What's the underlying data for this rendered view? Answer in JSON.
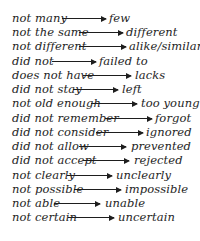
{
  "pairs": [
    {
      "from": "not many",
      "to": "few"
    },
    {
      "from": "not the same",
      "to": "different"
    },
    {
      "from": "not different",
      "to": "alike/similar"
    },
    {
      "from": "did not",
      "to": "failed to"
    },
    {
      "from": "does not have",
      "to": "lacks"
    },
    {
      "from": "did not stay",
      "to": "left"
    },
    {
      "from": "not old enough",
      "to": "too young"
    },
    {
      "from": "did not remember",
      "to": "forgot"
    },
    {
      "from": "did not consider",
      "to": "ignored"
    },
    {
      "from": "did not allow",
      "to": "prevented"
    },
    {
      "from": "did not accept",
      "to": "rejected"
    },
    {
      "from": "not clearly",
      "to": "unclearly"
    },
    {
      "from": "not possible",
      "to": "impossible"
    },
    {
      "from": "not able",
      "to": "unable"
    },
    {
      "from": "not certain",
      "to": "uncertain"
    }
  ],
  "icons": {
    "arrow": "right-arrow-icon"
  },
  "colors": {
    "text": "#1e1e1e",
    "background": "#ffffff"
  }
}
